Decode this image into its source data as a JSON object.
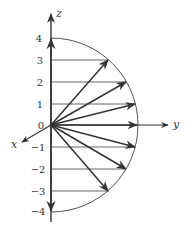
{
  "diagram": {
    "axes": {
      "z_label": "z",
      "y_label": "y",
      "x_label": "x"
    },
    "tick_labels": [
      "4",
      "3",
      "2",
      "1",
      "0",
      "−1",
      "−2",
      "−3",
      "−4"
    ],
    "tick_values": [
      4,
      3,
      2,
      1,
      0,
      -1,
      -2,
      -3,
      -4
    ],
    "radius": 4,
    "vector_z_components": [
      3,
      2,
      1,
      0,
      -1,
      -2,
      -3
    ],
    "colors": {
      "line": "#333333",
      "arc": "#555555",
      "background": "#ffffff"
    }
  }
}
